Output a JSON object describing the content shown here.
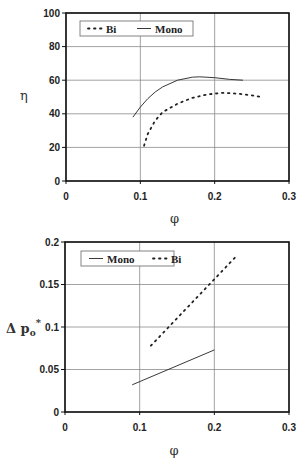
{
  "chart_data": [
    {
      "type": "line",
      "title": "",
      "xlabel": "φ",
      "ylabel": "η",
      "xlim": [
        0,
        0.3
      ],
      "ylim": [
        0,
        100
      ],
      "xticks": [
        "0",
        "0.1",
        "0.2",
        "0.3"
      ],
      "yticks": [
        "0",
        "20",
        "40",
        "60",
        "80",
        "100"
      ],
      "grid": true,
      "legend_position": "top-left inside",
      "legend": [
        "Bi",
        "Mono"
      ],
      "series": [
        {
          "name": "Bi",
          "style": "dotted",
          "x": [
            0.105,
            0.11,
            0.12,
            0.13,
            0.15,
            0.17,
            0.19,
            0.21,
            0.23,
            0.25,
            0.262
          ],
          "y": [
            21,
            28,
            36,
            41,
            46,
            49.5,
            51.5,
            52.5,
            52,
            51,
            50
          ]
        },
        {
          "name": "Mono",
          "style": "solid",
          "x": [
            0.09,
            0.1,
            0.11,
            0.12,
            0.13,
            0.15,
            0.17,
            0.18,
            0.2,
            0.22,
            0.238
          ],
          "y": [
            38,
            44,
            49,
            53,
            56,
            60,
            61.8,
            62,
            61.5,
            60.5,
            60
          ]
        }
      ]
    },
    {
      "type": "line",
      "title": "",
      "xlabel": "φ",
      "ylabel": "Δpo*",
      "xlim": [
        0,
        0.3
      ],
      "ylim": [
        0,
        0.2
      ],
      "xticks": [
        "0",
        "0.1",
        "0.2",
        "0.3"
      ],
      "yticks": [
        "0",
        "0.05",
        "0.1",
        "0.15",
        "0.2"
      ],
      "grid": true,
      "legend_position": "top-left inside",
      "legend": [
        "Mono",
        "Bi"
      ],
      "series": [
        {
          "name": "Mono",
          "style": "solid",
          "x": [
            0.09,
            0.2
          ],
          "y": [
            0.032,
            0.073
          ]
        },
        {
          "name": "Bi",
          "style": "dotted",
          "x": [
            0.115,
            0.228
          ],
          "y": [
            0.078,
            0.182
          ]
        }
      ]
    }
  ],
  "labels": {
    "top": {
      "ylabel": "η",
      "xlabel": "φ",
      "legend_bi": "Bi",
      "legend_mono": "Mono"
    },
    "bottom": {
      "ylabel_main": "Δ p",
      "ylabel_sub": "o",
      "ylabel_sup": "*",
      "xlabel": "φ",
      "legend_mono": "Mono",
      "legend_bi": "Bi"
    }
  }
}
